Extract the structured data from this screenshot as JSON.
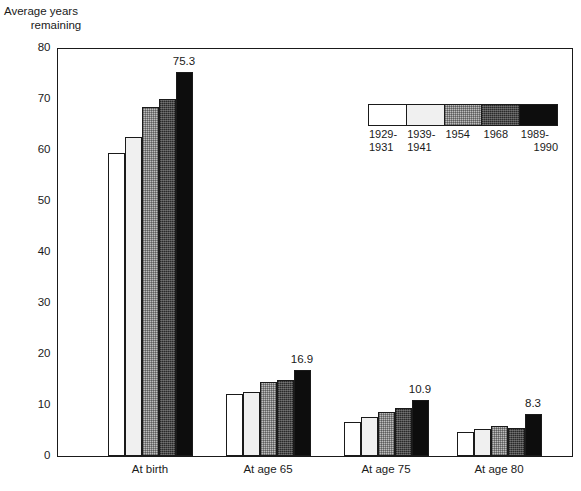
{
  "axis_title": {
    "line1": "Average years",
    "line2": "remaining"
  },
  "legend": {
    "items": [
      {
        "label_line1": "1929-",
        "label_line2": "1931",
        "swatch": "white-swatch"
      },
      {
        "label_line1": "1939-",
        "label_line2": "1941",
        "swatch": "light-gray-swatch"
      },
      {
        "label_line1": "1954",
        "label_line2": "",
        "swatch": "medium-gray-swatch"
      },
      {
        "label_line1": "1968",
        "label_line2": "",
        "swatch": "dark-gray-swatch"
      },
      {
        "label_line1": "1989-",
        "label_line2": "1990",
        "swatch": "black-swatch"
      }
    ]
  },
  "yticks": [
    "80",
    "70",
    "60",
    "50",
    "40",
    "30",
    "20",
    "10",
    "0"
  ],
  "chart_data": {
    "type": "bar",
    "title": "",
    "xlabel": "",
    "ylabel": "Average years remaining",
    "ylim": [
      0,
      80
    ],
    "ytick_step": 10,
    "grid": false,
    "legend_position": "inside-top-right",
    "categories": [
      "At birth",
      "At age 65",
      "At age 75",
      "At age 80"
    ],
    "series": [
      {
        "name": "1929-1931",
        "values": [
          59.5,
          12.2,
          6.6,
          4.7
        ]
      },
      {
        "name": "1939-1941",
        "values": [
          62.6,
          12.5,
          7.6,
          5.2
        ]
      },
      {
        "name": "1954",
        "values": [
          68.4,
          14.5,
          8.7,
          5.8
        ]
      },
      {
        "name": "1968",
        "values": [
          70.0,
          14.9,
          9.5,
          5.5
        ]
      },
      {
        "name": "1989-1990",
        "values": [
          75.3,
          16.9,
          10.9,
          8.3
        ]
      }
    ],
    "data_labels": {
      "At birth": "75.3",
      "At age 65": "16.9",
      "At age 75": "10.9",
      "At age 80": "8.3"
    }
  }
}
